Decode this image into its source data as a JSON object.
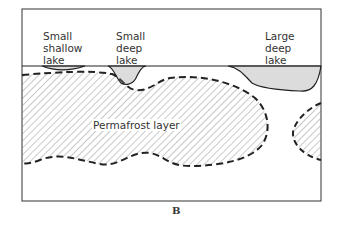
{
  "diagram": {
    "labels": {
      "small_shallow_lake": [
        "Small",
        "shallow",
        "lake"
      ],
      "small_deep_lake": [
        "Small",
        "deep",
        "lake"
      ],
      "large_deep_lake": [
        "Large",
        "deep",
        "lake"
      ],
      "permafrost": "Permafrost layer"
    },
    "figure_label": "B",
    "colors": {
      "line": "#222222",
      "hatch": "#666666",
      "background": "#ffffff"
    }
  }
}
